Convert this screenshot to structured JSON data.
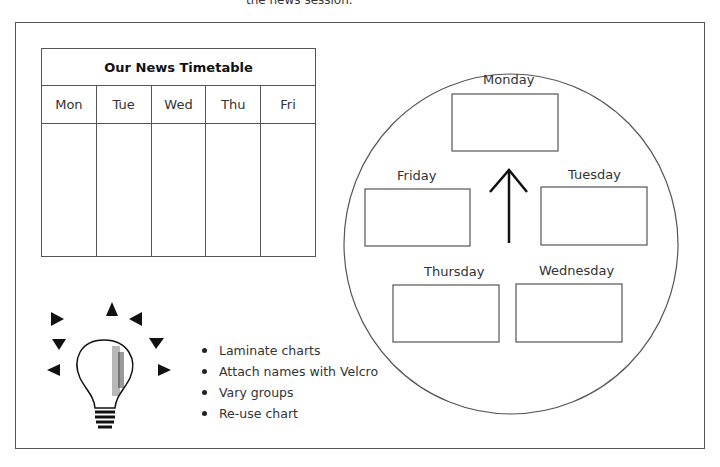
{
  "header": {
    "partial_text": "the news session."
  },
  "timetable": {
    "title": "Our News Timetable",
    "days": [
      "Mon",
      "Tue",
      "Wed",
      "Thu",
      "Fri"
    ]
  },
  "rotation_chart": {
    "days": {
      "monday": "Monday",
      "tuesday": "Tuesday",
      "wednesday": "Wednesday",
      "thursday": "Thursday",
      "friday": "Friday"
    },
    "arrow": "up-arrow"
  },
  "tips": {
    "icon": "lightbulb-icon",
    "items": [
      "Laminate charts",
      "Attach names with Velcro",
      "Vary groups",
      "Re-use chart"
    ]
  }
}
